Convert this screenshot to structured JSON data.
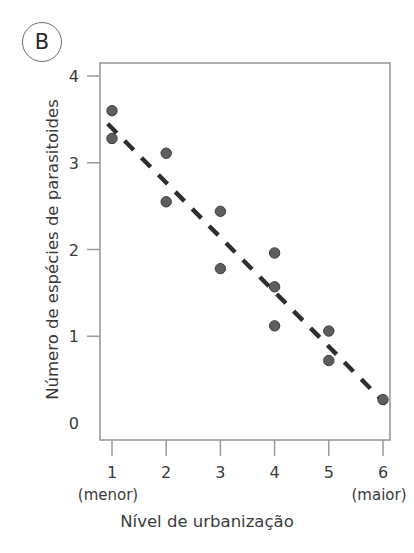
{
  "figure": {
    "panel_label": "B",
    "background_color": "#ffffff",
    "frame_color": "#9a9a9a",
    "dot_color": "#5e5e5e",
    "trendline_color": "#2e2e2e"
  },
  "chart_data": {
    "type": "scatter",
    "title": "",
    "subtitle": "",
    "panel": "B",
    "xlabel": "Nível de urbanização",
    "ylabel": "Número de espécies de parasitoides",
    "x_tick_labels": [
      "1",
      "2",
      "3",
      "4",
      "5",
      "6"
    ],
    "x_tick_values": [
      1,
      2,
      3,
      4,
      5,
      6
    ],
    "x_end_annotations": {
      "left": "(menor)",
      "right": "(maior)"
    },
    "y_tick_labels": [
      "0",
      "1",
      "2",
      "3",
      "4"
    ],
    "y_tick_values": [
      0,
      1,
      2,
      3,
      4
    ],
    "xlim": [
      0.6,
      6.4
    ],
    "ylim": [
      0,
      4.15
    ],
    "grid": false,
    "legend": null,
    "points": [
      {
        "x": 1,
        "y": 3.6
      },
      {
        "x": 1,
        "y": 3.28
      },
      {
        "x": 2,
        "y": 3.11
      },
      {
        "x": 2,
        "y": 2.55
      },
      {
        "x": 3,
        "y": 2.44
      },
      {
        "x": 3,
        "y": 1.78
      },
      {
        "x": 4,
        "y": 1.96
      },
      {
        "x": 4,
        "y": 1.57
      },
      {
        "x": 4,
        "y": 1.12
      },
      {
        "x": 5,
        "y": 1.06
      },
      {
        "x": 5,
        "y": 0.72
      },
      {
        "x": 6,
        "y": 0.27
      }
    ],
    "trendline": {
      "style": "dashed",
      "x_start": 0.92,
      "y_start": 3.45,
      "x_end": 6.05,
      "y_end": 0.22
    }
  }
}
